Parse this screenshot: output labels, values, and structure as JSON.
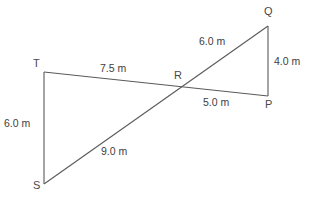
{
  "diagram": {
    "units": "m",
    "stroke_color": "#5a5a5a",
    "text_color": "#3d3d3d",
    "background_color": "#ffffff",
    "vertices": [
      {
        "name": "T",
        "label": "T",
        "x": 44,
        "y": 72,
        "label_x": 33,
        "label_y": 58
      },
      {
        "name": "S",
        "label": "S",
        "x": 44,
        "y": 184,
        "label_x": 33,
        "label_y": 180
      },
      {
        "name": "R",
        "label": "R",
        "x": 178,
        "y": 88,
        "label_x": 174,
        "label_y": 70
      },
      {
        "name": "Q",
        "label": "Q",
        "x": 268,
        "y": 26,
        "label_x": 264,
        "label_y": 6
      },
      {
        "name": "P",
        "label": "P",
        "x": 268,
        "y": 96,
        "label_x": 265,
        "label_y": 99
      }
    ],
    "segments": [
      {
        "name": "segment-TS",
        "from": "T",
        "to": "S"
      },
      {
        "name": "segment-TP",
        "from": "T",
        "to": "P"
      },
      {
        "name": "segment-SQ",
        "from": "S",
        "to": "Q"
      },
      {
        "name": "segment-QP",
        "from": "Q",
        "to": "P"
      }
    ],
    "measurements": [
      {
        "name": "length-TR",
        "segment": "TR",
        "value": "7.5 m",
        "x": 100,
        "y": 63
      },
      {
        "name": "length-TS",
        "segment": "TS",
        "value": "6.0 m",
        "x": 4,
        "y": 118
      },
      {
        "name": "length-SR",
        "segment": "SR",
        "value": "9.0 m",
        "x": 101,
        "y": 146
      },
      {
        "name": "length-QR",
        "segment": "QR",
        "value": "6.0 m",
        "x": 199,
        "y": 36
      },
      {
        "name": "length-QP",
        "segment": "QP",
        "value": "4.0 m",
        "x": 274,
        "y": 56
      },
      {
        "name": "length-RP",
        "segment": "RP",
        "value": "5.0 m",
        "x": 203,
        "y": 97
      }
    ]
  }
}
